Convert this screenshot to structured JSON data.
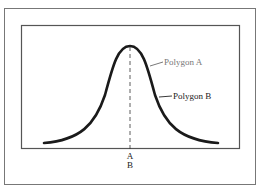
{
  "figure": {
    "labels": {
      "polygon_a": "Polygon A",
      "polygon_b": "Polygon B",
      "axis_mark_a": "A",
      "axis_mark_b": "B"
    },
    "colors": {
      "curve": "#1a1a1a",
      "frame": "#555555",
      "label_a": "#777777",
      "label_b": "#222222"
    }
  }
}
